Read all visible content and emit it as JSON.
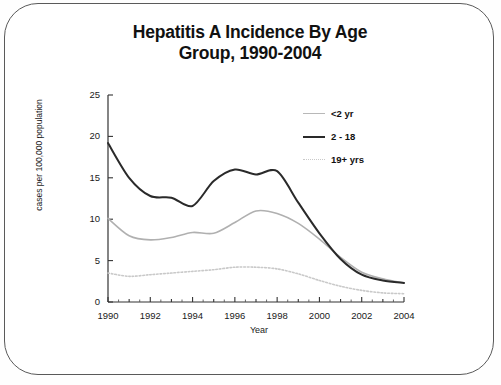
{
  "figure": {
    "title_line1": "Hepatitis A Incidence By Age",
    "title_line2": "Group, 1990-2004",
    "border_color": "#5a5a5a"
  },
  "chart_data": {
    "type": "line",
    "title": "Hepatitis A Incidence By Age Group, 1990-2004",
    "xlabel": "Year",
    "ylabel": "cases per 100,000 population",
    "xlim": [
      1990,
      2004
    ],
    "ylim": [
      0,
      25
    ],
    "ytick_labels": [
      "0",
      "5",
      "10",
      "15",
      "20",
      "25"
    ],
    "ytick_values": [
      0,
      5,
      10,
      15,
      20,
      25
    ],
    "xtick_labels": [
      "1990",
      "1992",
      "1994",
      "1996",
      "1998",
      "2000",
      "2002",
      "2004"
    ],
    "xtick_values": [
      1990,
      1992,
      1994,
      1996,
      1998,
      2000,
      2002,
      2004
    ],
    "minor_xticks_every": 1,
    "grid": false,
    "legend_position": "upper right",
    "x": [
      1990,
      1991,
      1992,
      1993,
      1994,
      1995,
      1996,
      1997,
      1998,
      1999,
      2000,
      2001,
      2002,
      2003,
      2004
    ],
    "series": [
      {
        "name": "<2 yr",
        "style": "solid",
        "color": "#b0b0b0",
        "values": [
          10.1,
          8.0,
          7.5,
          7.8,
          8.4,
          8.3,
          9.6,
          11.0,
          10.7,
          9.5,
          7.6,
          5.4,
          3.6,
          2.8,
          2.3
        ]
      },
      {
        "name": "2 - 18",
        "style": "solid",
        "color": "#2a2a2a",
        "values": [
          19.2,
          15.0,
          12.8,
          12.6,
          11.6,
          14.6,
          16.0,
          15.4,
          15.8,
          12.0,
          8.3,
          5.2,
          3.3,
          2.6,
          2.3
        ]
      },
      {
        "name": "19+ yrs",
        "style": "dotted",
        "color": "#c9c9c9",
        "values": [
          3.5,
          3.1,
          3.3,
          3.5,
          3.7,
          3.9,
          4.2,
          4.2,
          4.0,
          3.4,
          2.6,
          1.9,
          1.4,
          1.1,
          1.0
        ]
      }
    ]
  }
}
